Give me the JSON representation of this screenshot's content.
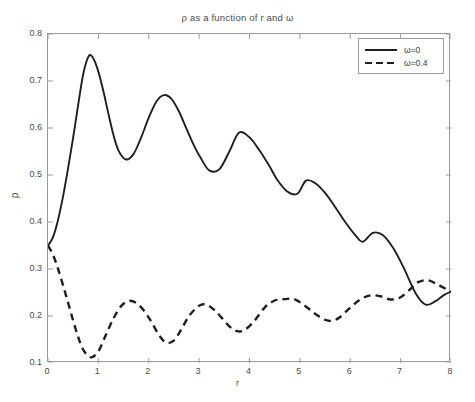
{
  "chart_data": {
    "type": "line",
    "title": "ρ as a function of r and ω",
    "xlabel": "r",
    "ylabel": "ρ",
    "xlim": [
      0,
      8
    ],
    "ylim": [
      0.1,
      0.8
    ],
    "xticks": [
      "0",
      "1",
      "2",
      "3",
      "4",
      "5",
      "6",
      "7",
      "8"
    ],
    "yticks": [
      "0.1",
      "0.2",
      "0.3",
      "0.4",
      "0.5",
      "0.6",
      "0.7",
      "0.8"
    ],
    "grid": false,
    "legend_position": "top-right",
    "line_color": "#1f1f1f",
    "series": [
      {
        "name": "ω=0",
        "style": "solid",
        "x": [
          0.0,
          0.1,
          0.2,
          0.3,
          0.4,
          0.5,
          0.6,
          0.7,
          0.81,
          0.9,
          1.0,
          1.1,
          1.2,
          1.3,
          1.4,
          1.55,
          1.7,
          1.85,
          2.0,
          2.15,
          2.3,
          2.45,
          2.6,
          2.75,
          2.9,
          3.05,
          3.2,
          3.4,
          3.6,
          3.79,
          4.0,
          4.2,
          4.4,
          4.55,
          4.75,
          4.95,
          5.12,
          5.3,
          5.5,
          5.7,
          5.9,
          6.1,
          6.25,
          6.45,
          6.65,
          6.85,
          7.05,
          7.3,
          7.5,
          7.7,
          7.85,
          8.0
        ],
        "y": [
          0.35,
          0.368,
          0.405,
          0.455,
          0.515,
          0.58,
          0.65,
          0.715,
          0.753,
          0.748,
          0.72,
          0.678,
          0.63,
          0.585,
          0.552,
          0.533,
          0.545,
          0.58,
          0.622,
          0.656,
          0.67,
          0.662,
          0.635,
          0.598,
          0.562,
          0.533,
          0.51,
          0.512,
          0.55,
          0.59,
          0.58,
          0.552,
          0.518,
          0.49,
          0.465,
          0.46,
          0.488,
          0.483,
          0.462,
          0.432,
          0.4,
          0.372,
          0.358,
          0.377,
          0.372,
          0.345,
          0.305,
          0.248,
          0.224,
          0.232,
          0.244,
          0.252
        ]
      },
      {
        "name": "ω=0.4",
        "style": "dashed",
        "x": [
          0.0,
          0.1,
          0.2,
          0.3,
          0.4,
          0.5,
          0.6,
          0.7,
          0.85,
          1.0,
          1.15,
          1.3,
          1.45,
          1.6,
          1.75,
          1.9,
          2.05,
          2.2,
          2.35,
          2.5,
          2.65,
          2.8,
          3.0,
          3.15,
          3.3,
          3.45,
          3.6,
          3.75,
          3.9,
          4.1,
          4.3,
          4.5,
          4.7,
          4.88,
          5.1,
          5.3,
          5.5,
          5.65,
          5.8,
          6.0,
          6.2,
          6.4,
          6.6,
          6.8,
          7.0,
          7.2,
          7.35,
          7.55,
          7.75,
          8.0
        ],
        "y": [
          0.35,
          0.33,
          0.3,
          0.265,
          0.228,
          0.19,
          0.155,
          0.128,
          0.112,
          0.125,
          0.16,
          0.195,
          0.221,
          0.232,
          0.228,
          0.212,
          0.188,
          0.16,
          0.143,
          0.148,
          0.172,
          0.2,
          0.222,
          0.224,
          0.213,
          0.196,
          0.178,
          0.168,
          0.17,
          0.19,
          0.218,
          0.233,
          0.236,
          0.236,
          0.222,
          0.205,
          0.192,
          0.19,
          0.198,
          0.218,
          0.235,
          0.244,
          0.242,
          0.235,
          0.24,
          0.258,
          0.272,
          0.276,
          0.266,
          0.252
        ]
      }
    ]
  },
  "legend": {
    "entries": [
      {
        "label": "ω=0",
        "style": "solid"
      },
      {
        "label": "ω=0.4",
        "style": "dashed"
      }
    ]
  }
}
